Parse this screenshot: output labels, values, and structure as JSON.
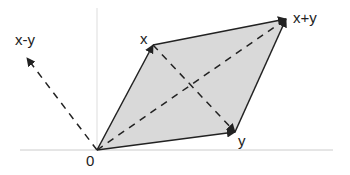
{
  "diagram": {
    "labels": {
      "origin": "0",
      "x": "x",
      "y": "y",
      "sum": "x+y",
      "difference": "x-y"
    },
    "points": {
      "origin": [
        97,
        150
      ],
      "x": [
        153,
        45
      ],
      "y": [
        235,
        132
      ],
      "sum": [
        286,
        19
      ],
      "difference_tip": [
        27,
        58
      ]
    },
    "colors": {
      "fill": "#d9d9d9",
      "stroke": "#222222",
      "axis": "#cccccc",
      "background": "#ffffff"
    },
    "axes": {
      "horizontal": {
        "x1": 20,
        "x2": 333,
        "y": 150
      },
      "vertical": {
        "x": 97,
        "y1": 8,
        "y2": 150
      }
    }
  }
}
